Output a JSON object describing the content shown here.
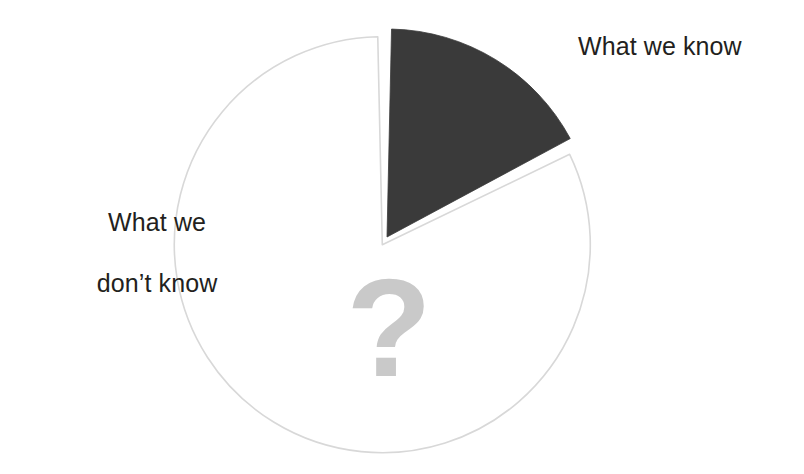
{
  "figure": {
    "background_color": "#ffffff",
    "question_mark": "?",
    "question_mark_color": "#c9c9c9"
  },
  "labels": {
    "known": "What we know",
    "unknown_line1": "What we",
    "unknown_line2": "don’t know"
  },
  "chart_data": {
    "type": "pie",
    "title": "",
    "subtitle": "",
    "xlabel": "",
    "ylabel": "",
    "legend_position": "callout-labels",
    "grid": false,
    "center": {
      "x": 387,
      "y": 237
    },
    "radius": 208,
    "start_angle_deg": 0,
    "direction": "clockwise",
    "gap_deg": 2.5,
    "categories": [
      "What we know",
      "What we don’t know"
    ],
    "values": [
      17.5,
      82.5
    ],
    "slices": [
      {
        "label": "What we know",
        "value": 17.5,
        "unit": "%",
        "start_angle_deg": 0,
        "end_angle_deg": 63,
        "fill": "#3a3a3a",
        "stroke": "#3a3a3a",
        "exploded": false,
        "label_text": "What we know",
        "label_position": "right"
      },
      {
        "label": "What we don’t know",
        "value": 82.5,
        "unit": "%",
        "start_angle_deg": 63,
        "end_angle_deg": 360,
        "fill": "#ffffff",
        "stroke": "#d8d8d8",
        "exploded": true,
        "label_text": "What we\ndon’t know",
        "label_position": "left"
      }
    ],
    "annotations": [
      {
        "text": "?",
        "x": 389,
        "y": 340,
        "color": "#c9c9c9"
      }
    ]
  },
  "colors": {
    "known_slice": "#3a3a3a",
    "unknown_slice": "#ffffff",
    "unknown_slice_outline": "#d8d8d8",
    "text": "#231f20",
    "question_mark": "#c9c9c9",
    "background": "#ffffff"
  }
}
